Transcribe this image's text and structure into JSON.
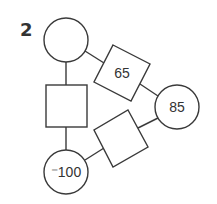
{
  "problem": {
    "number": "2"
  },
  "nodes": {
    "top_circle": {
      "value": ""
    },
    "right_circle": {
      "value": "85"
    },
    "bottom_circle": {
      "value": "⁻100"
    },
    "top_right_square": {
      "value": "65"
    },
    "left_square": {
      "value": ""
    },
    "bottom_right_square": {
      "value": ""
    }
  },
  "colors": {
    "stroke": "#3a3a3a",
    "text": "#333333",
    "background": "#ffffff"
  }
}
